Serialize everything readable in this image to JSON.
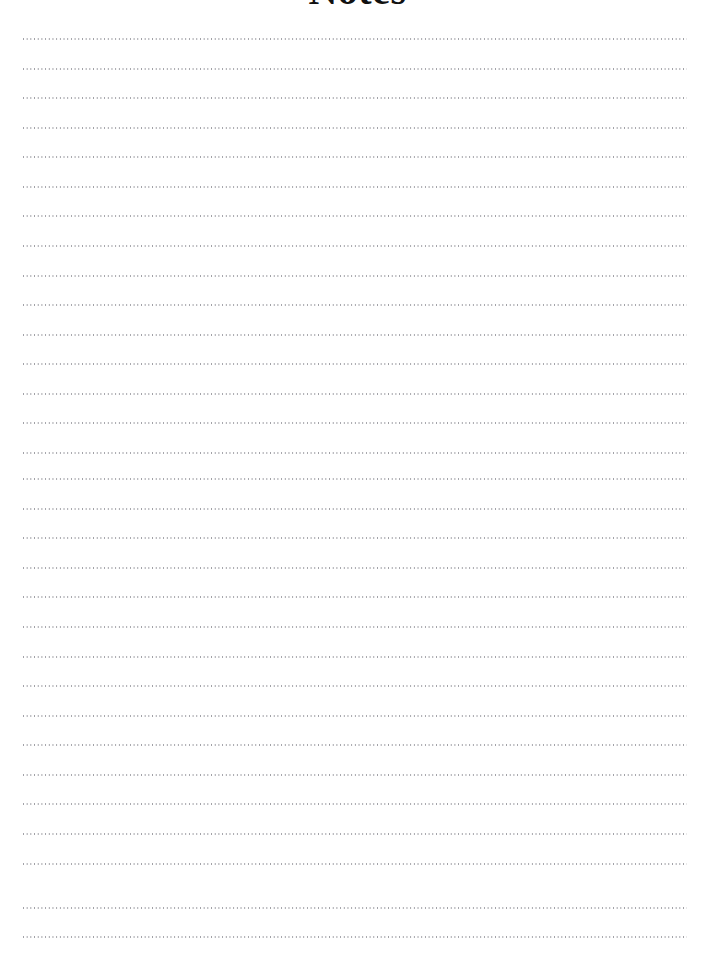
{
  "document": {
    "title": "Notes",
    "page_width": 715,
    "page_height": 955,
    "background_color": "#ffffff",
    "title_color": "#111111",
    "title_clipped_at_top": true
  },
  "ruling": {
    "style": "dotted",
    "line_color": "#8d8d94",
    "line_count": 31,
    "first_line_y": 38,
    "line_spacing": 29.6,
    "left_margin": 23,
    "right_margin": 28,
    "line_width": 664,
    "dot_period": 3.7,
    "dot_size": 1.35,
    "lines": [
      {
        "index": 1,
        "y": 38,
        "content": ""
      },
      {
        "index": 2,
        "y": 68,
        "content": ""
      },
      {
        "index": 3,
        "y": 97,
        "content": ""
      },
      {
        "index": 4,
        "y": 127,
        "content": ""
      },
      {
        "index": 5,
        "y": 156,
        "content": ""
      },
      {
        "index": 6,
        "y": 186,
        "content": ""
      },
      {
        "index": 7,
        "y": 215,
        "content": ""
      },
      {
        "index": 8,
        "y": 245,
        "content": ""
      },
      {
        "index": 9,
        "y": 275,
        "content": ""
      },
      {
        "index": 10,
        "y": 304,
        "content": ""
      },
      {
        "index": 11,
        "y": 334,
        "content": ""
      },
      {
        "index": 12,
        "y": 363,
        "content": ""
      },
      {
        "index": 13,
        "y": 393,
        "content": ""
      },
      {
        "index": 14,
        "y": 422,
        "content": ""
      },
      {
        "index": 15,
        "y": 452,
        "content": ""
      },
      {
        "index": 16,
        "y": 478,
        "content": ""
      },
      {
        "index": 17,
        "y": 508,
        "content": ""
      },
      {
        "index": 18,
        "y": 537,
        "content": ""
      },
      {
        "index": 19,
        "y": 567,
        "content": ""
      },
      {
        "index": 20,
        "y": 596,
        "content": ""
      },
      {
        "index": 21,
        "y": 626,
        "content": ""
      },
      {
        "index": 22,
        "y": 656,
        "content": ""
      },
      {
        "index": 23,
        "y": 685,
        "content": ""
      },
      {
        "index": 24,
        "y": 715,
        "content": ""
      },
      {
        "index": 25,
        "y": 744,
        "content": ""
      },
      {
        "index": 26,
        "y": 774,
        "content": ""
      },
      {
        "index": 27,
        "y": 803,
        "content": ""
      },
      {
        "index": 28,
        "y": 833,
        "content": ""
      },
      {
        "index": 29,
        "y": 863,
        "content": ""
      },
      {
        "index": 30,
        "y": 907,
        "content": ""
      },
      {
        "index": 31,
        "y": 936,
        "content": ""
      }
    ]
  }
}
